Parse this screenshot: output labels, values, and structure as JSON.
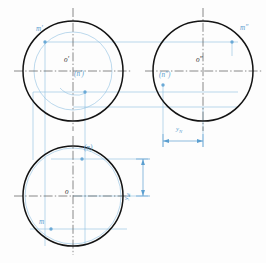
{
  "drawing": {
    "title": "Sphere three-view projection with surface points M and N",
    "colors": {
      "outline": "#1a1a1a",
      "construction": "#7fb8dd",
      "centerline": "#3a3a3a",
      "dimension": "#5b9fd0",
      "point_fill": "#6aa9d6",
      "background": "#ffffff"
    },
    "views": [
      {
        "id": "front-view",
        "name": "front view (V projection)",
        "center": {
          "x": 73,
          "y": 71
        },
        "radius": 50,
        "center_label": "o′",
        "inner_circle": {
          "center": {
            "x": 73,
            "y": 71
          },
          "radius": 39,
          "note": "auxiliary latitude circle"
        },
        "points": [
          {
            "name": "m-prime",
            "label": "m′",
            "x": 45,
            "y": 42,
            "label_x": 36,
            "label_y": 29
          },
          {
            "name": "n-prime",
            "label": "(n′)",
            "x": 85,
            "y": 92,
            "label_x": 75,
            "label_y": 74
          }
        ]
      },
      {
        "id": "side-view",
        "name": "side view (W projection)",
        "center": {
          "x": 203,
          "y": 71
        },
        "radius": 50,
        "center_label": "o″",
        "points": [
          {
            "name": "m-double-prime",
            "label": "m″",
            "x": 232,
            "y": 42,
            "label_x": 240,
            "label_y": 28
          },
          {
            "name": "n-double-prime",
            "label": "(n″)",
            "x": 163,
            "y": 85,
            "label_x": 160,
            "label_y": 76
          }
        ]
      },
      {
        "id": "top-view",
        "name": "top view (H projection)",
        "center": {
          "x": 73,
          "y": 196
        },
        "radius": 50,
        "center_label": "o",
        "inner_circle": {
          "center": {
            "x": 73,
            "y": 196
          },
          "radius": 48,
          "note": "light construction outline"
        },
        "points": [
          {
            "name": "n-top",
            "label": "(n)",
            "x": 82,
            "y": 159,
            "label_x": 85,
            "label_y": 148
          },
          {
            "name": "m-top",
            "label": "m",
            "x": 51,
            "y": 229,
            "label_x": 40,
            "label_y": 221
          }
        ]
      }
    ],
    "dimensions": [
      {
        "id": "y-n",
        "orientation": "horizontal",
        "label": "y",
        "subscript": "N",
        "from_x": 163,
        "to_x": 203,
        "y": 141,
        "label_x": 176,
        "label_y": 126
      },
      {
        "id": "y-m",
        "orientation": "vertical",
        "label": "y",
        "subscript": "M",
        "from_y": 159,
        "to_y": 196,
        "x": 143,
        "label_x": 131,
        "label_y": 184
      }
    ],
    "centerlines": [
      {
        "id": "front-vertical",
        "x1": 73,
        "y1": 8,
        "x2": 73,
        "y2": 131
      },
      {
        "id": "front-horizontal",
        "x1": 14,
        "y1": 71,
        "x2": 131,
        "y2": 71
      },
      {
        "id": "side-vertical",
        "x1": 203,
        "y1": 8,
        "x2": 203,
        "y2": 131
      },
      {
        "id": "side-horizontal",
        "x1": 145,
        "y1": 71,
        "x2": 262,
        "y2": 71
      },
      {
        "id": "top-vertical",
        "x1": 73,
        "y1": 136,
        "x2": 73,
        "y2": 255
      },
      {
        "id": "top-horizontal",
        "x1": 14,
        "y1": 196,
        "x2": 131,
        "y2": 196
      }
    ]
  }
}
